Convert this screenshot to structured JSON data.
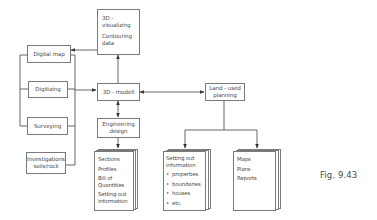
{
  "figure": {
    "caption": "Fig. 9.43"
  },
  "nodes": {
    "visualizing": {
      "lines": [
        "3D -",
        "visualizing",
        "Contouring",
        "data"
      ]
    },
    "digital_map": {
      "label": "Digital map"
    },
    "digitizing": {
      "label": "Digitizing"
    },
    "surveying": {
      "label": "Surveying"
    },
    "investigations": {
      "lines": [
        "Investigations",
        "soils/rock"
      ]
    },
    "modell": {
      "label": "3D - modell"
    },
    "engineering": {
      "lines": [
        "Engineering",
        "design"
      ]
    },
    "land_use": {
      "lines": [
        "Land - used",
        "planning"
      ]
    }
  },
  "documents": {
    "engineering_outputs": {
      "lines": [
        "Sections",
        "Profiles",
        "Bill of",
        "Quantities",
        "Setting out",
        "information"
      ]
    },
    "setting_out": {
      "title_lines": [
        "Setting out",
        "information"
      ],
      "bullets": [
        "properties",
        "boundaries",
        "houses",
        "etc."
      ]
    },
    "maps": {
      "lines": [
        "Maps",
        "Plans",
        "Reports"
      ]
    }
  },
  "edges": [
    {
      "from": "visualizing",
      "to": "digital_map",
      "type": "arrow"
    },
    {
      "from": "modell",
      "to": "visualizing",
      "type": "arrow"
    },
    {
      "from": "data_sources_bracket",
      "to": "modell",
      "type": "arrow"
    },
    {
      "from": "modell",
      "to": "land_use",
      "type": "bidirectional"
    },
    {
      "from": "modell",
      "to": "engineering",
      "type": "bidirectional"
    },
    {
      "from": "engineering",
      "to": "engineering_outputs",
      "type": "arrow"
    },
    {
      "from": "land_use",
      "to": "setting_out",
      "type": "arrow"
    },
    {
      "from": "land_use",
      "to": "maps",
      "type": "arrow"
    }
  ]
}
